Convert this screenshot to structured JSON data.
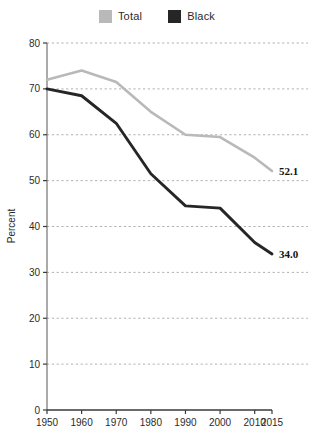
{
  "legend": {
    "position": "top-center",
    "entries": [
      {
        "label": "Total",
        "color": "#b9b9b9",
        "swatch_name": "legend-swatch-total"
      },
      {
        "label": "Black",
        "color": "#262626",
        "swatch_name": "legend-swatch-black"
      }
    ]
  },
  "axes": {
    "ylabel": "Percent",
    "xlabel": "",
    "ylim": [
      0,
      80
    ],
    "xlim": [
      1950,
      2015
    ],
    "yticks": [
      "0",
      "10",
      "20",
      "30",
      "40",
      "50",
      "60",
      "70",
      "80"
    ],
    "xticks": [
      "1950",
      "1960",
      "1970",
      "1980",
      "1990",
      "2000",
      "2010",
      "2015"
    ]
  },
  "annotations": [
    {
      "text": "52.1",
      "series": "Total",
      "x": 2015,
      "y": 52.1
    },
    {
      "text": "34.0",
      "series": "Black",
      "x": 2015,
      "y": 34.0
    }
  ],
  "chart_data": {
    "type": "line",
    "title": "",
    "subtitle": "",
    "xlabel": "",
    "ylabel": "Percent",
    "xlim": [
      1950,
      2015
    ],
    "ylim": [
      0,
      80
    ],
    "grid": true,
    "grid_axis": "y",
    "grid_style": "dashed",
    "legend_position": "top-center",
    "x": [
      1950,
      1960,
      1970,
      1980,
      1990,
      2000,
      2010,
      2015
    ],
    "series": [
      {
        "name": "Total",
        "color": "#b9b9b9",
        "values": [
          72.0,
          74.0,
          71.5,
          65.0,
          60.0,
          59.5,
          55.0,
          52.1
        ],
        "end_label": "52.1"
      },
      {
        "name": "Black",
        "color": "#262626",
        "values": [
          70.0,
          68.5,
          62.5,
          51.5,
          44.5,
          44.0,
          36.5,
          34.0
        ],
        "end_label": "34.0"
      }
    ]
  }
}
